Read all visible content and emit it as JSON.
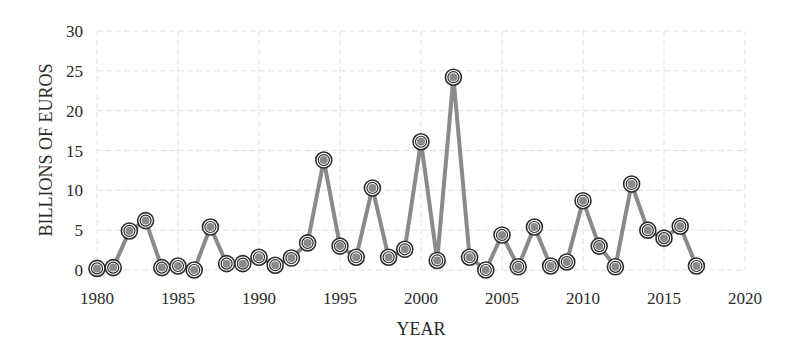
{
  "chart_data": {
    "type": "line",
    "title": "",
    "xlabel": "YEAR",
    "ylabel": "BILLIONS  OF EUROS",
    "xlim": [
      1980,
      2020
    ],
    "ylim": [
      0,
      30
    ],
    "x_ticks": [
      1980,
      1985,
      1990,
      1995,
      2000,
      2005,
      2010,
      2015,
      2020
    ],
    "y_ticks": [
      0,
      5,
      10,
      15,
      20,
      25,
      30
    ],
    "grid": true,
    "legend": null,
    "x": [
      1980,
      1981,
      1982,
      1983,
      1984,
      1985,
      1986,
      1987,
      1988,
      1989,
      1990,
      1991,
      1992,
      1993,
      1994,
      1995,
      1996,
      1997,
      1998,
      1999,
      2000,
      2001,
      2002,
      2003,
      2004,
      2005,
      2006,
      2007,
      2008,
      2009,
      2010,
      2011,
      2012,
      2013,
      2014,
      2015,
      2016,
      2017
    ],
    "series": [
      {
        "name": "Billions of Euros",
        "values": [
          0.2,
          0.3,
          4.9,
          6.2,
          0.3,
          0.5,
          0.0,
          5.4,
          0.8,
          0.8,
          1.6,
          0.6,
          1.5,
          3.4,
          13.8,
          3.0,
          1.6,
          10.3,
          1.6,
          2.6,
          16.1,
          1.2,
          24.2,
          1.6,
          0.0,
          4.4,
          0.4,
          5.4,
          0.5,
          1.0,
          8.7,
          3.0,
          0.4,
          10.8,
          5.0,
          4.0,
          5.5,
          0.5
        ],
        "color": "#8a8a8a",
        "marker": "double-circle"
      }
    ]
  }
}
